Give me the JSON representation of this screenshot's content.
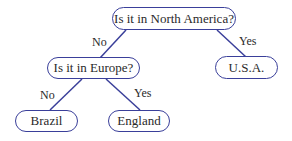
{
  "diagram": {
    "type": "decision-tree",
    "line_color": "#3a3f9a",
    "nodes": {
      "root": {
        "label": "Is it in North America?"
      },
      "europe": {
        "label": "Is it in Europe?"
      },
      "usa": {
        "label": "U.S.A."
      },
      "brazil": {
        "label": "Brazil"
      },
      "england": {
        "label": "England"
      }
    },
    "edges": {
      "root_to_europe": {
        "label": "No"
      },
      "root_to_usa": {
        "label": "Yes"
      },
      "europe_to_brazil": {
        "label": "No"
      },
      "europe_to_england": {
        "label": "Yes"
      }
    }
  }
}
